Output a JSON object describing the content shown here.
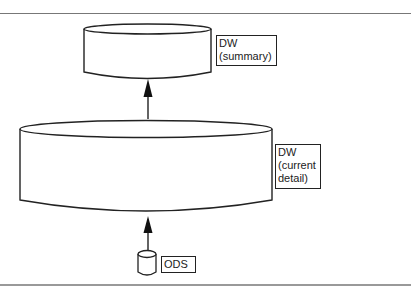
{
  "diagram": {
    "type": "data-flow",
    "nodes": [
      {
        "id": "dw_summary",
        "shape": "cylinder",
        "label_lines": [
          "DW",
          "(summary)"
        ]
      },
      {
        "id": "dw_current_detail",
        "shape": "cylinder",
        "label_lines": [
          "DW",
          "(current",
          "detail)"
        ]
      },
      {
        "id": "ods",
        "shape": "cylinder",
        "label_lines": [
          "ODS"
        ]
      }
    ],
    "edges": [
      {
        "from": "ods",
        "to": "dw_current_detail",
        "style": "arrow"
      },
      {
        "from": "dw_current_detail",
        "to": "dw_summary",
        "style": "arrow"
      }
    ]
  },
  "labels": {
    "summary": {
      "line1": "DW",
      "line2": "(summary)"
    },
    "current": {
      "line1": "DW",
      "line2": "(current",
      "line3": "detail)"
    },
    "ods": {
      "line1": "ODS"
    }
  },
  "colors": {
    "stroke": "#222222",
    "background": "#ffffff",
    "rule": "#777777"
  }
}
